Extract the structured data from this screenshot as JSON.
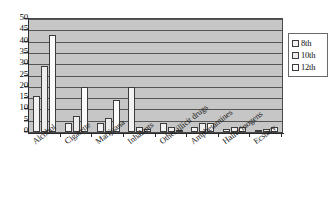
{
  "chart_data": {
    "type": "bar",
    "title": "",
    "xlabel": "",
    "ylabel": "",
    "ylim": [
      0,
      50
    ],
    "ytick_step": 5,
    "yticks": [
      "50",
      "45",
      "40",
      "35",
      "30",
      "25",
      "20",
      "15",
      "10",
      "5",
      "0"
    ],
    "grid": true,
    "legend_position": "right",
    "categories": [
      "Alcohol",
      "Cigarette",
      "Marijuana",
      "Inhalants",
      "Other illicit drugs",
      "Amphetamines",
      "Hallucinogens",
      "Ecstacy"
    ],
    "series": [
      {
        "name": "8th",
        "values": [
          16,
          4,
          4,
          20,
          4,
          2,
          1.5,
          1
        ]
      },
      {
        "name": "10th",
        "values": [
          29,
          7,
          6,
          2,
          2,
          4,
          2,
          1.5
        ]
      },
      {
        "name": "12th",
        "values": [
          43,
          20,
          14,
          1.5,
          1,
          4,
          2,
          2
        ]
      }
    ]
  },
  "legend": {
    "items": [
      {
        "label": "8th"
      },
      {
        "label": "10th"
      },
      {
        "label": "12th"
      }
    ]
  }
}
